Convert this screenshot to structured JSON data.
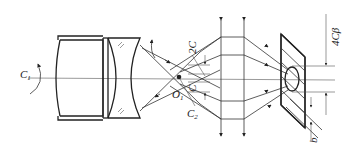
{
  "diagram": {
    "type": "optical-schematic",
    "labels": {
      "c1": "C",
      "c1_sub": "1",
      "o1": "O",
      "o1_sub": "1",
      "c2": "C",
      "c2_sub": "2",
      "c_center": "C",
      "two_c": "2C",
      "four_c_beta": "4Cβ",
      "b": "b"
    },
    "colors": {
      "line": "#333333",
      "background": "#ffffff"
    }
  }
}
